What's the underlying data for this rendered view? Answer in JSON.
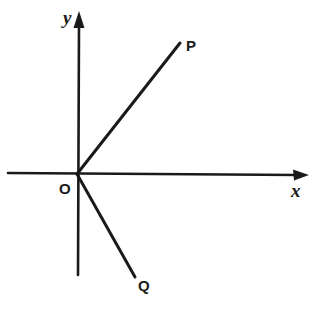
{
  "diagram": {
    "type": "coordinate-axes-with-rays",
    "colors": {
      "ink": "#1a1a1a",
      "background": "#ffffff"
    },
    "axes": {
      "x": {
        "label": "x",
        "from": [
          8,
          173
        ],
        "to": [
          308,
          175
        ]
      },
      "y": {
        "label": "y",
        "from": [
          78,
          275
        ],
        "to": [
          79,
          12
        ]
      }
    },
    "origin": {
      "label": "O",
      "point": [
        77,
        174
      ]
    },
    "rays": [
      {
        "id": "OP",
        "label": "P",
        "from": [
          77,
          174
        ],
        "to": [
          180,
          43
        ]
      },
      {
        "id": "OQ",
        "label": "Q",
        "from": [
          77,
          174
        ],
        "to": [
          135,
          277
        ]
      }
    ]
  }
}
